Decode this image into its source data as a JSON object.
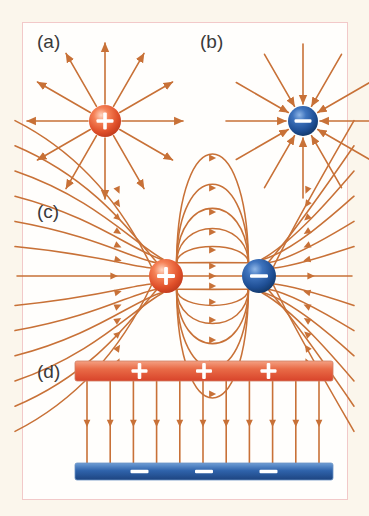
{
  "figure": {
    "background_color": "#fbf6ec",
    "page_color": "#fffefc",
    "border_color": "#f2c9c9",
    "field_line_color": "#c87137",
    "positive_color": "#e0502a",
    "positive_color_light": "#f79b7a",
    "negative_color": "#1f4f95",
    "negative_color_light": "#5b8fd4",
    "plate_positive_color": "#e35336",
    "plate_negative_color": "#2d5ea8"
  },
  "panels": [
    {
      "id": "a",
      "label": "(a)",
      "kind": "point-charge",
      "charge_sign": "+",
      "charge_symbol": "+",
      "field_direction": "outward",
      "num_field_lines": 12,
      "charge_center": [
        82,
        98
      ],
      "charge_radius": 16,
      "line_length": 62
    },
    {
      "id": "b",
      "label": "(b)",
      "kind": "point-charge",
      "charge_sign": "-",
      "charge_symbol": "−",
      "field_direction": "inward",
      "num_field_lines": 12,
      "charge_center": [
        117,
        98
      ],
      "charge_radius": 15,
      "line_length": 62
    },
    {
      "id": "c",
      "label": "(c)",
      "kind": "dipole",
      "positive_center": [
        143,
        79
      ],
      "negative_center": [
        236,
        79
      ],
      "charge_radius": 17,
      "num_field_lines": 13,
      "field_direction": "positive-to-negative"
    },
    {
      "id": "d",
      "label": "(d)",
      "kind": "parallel-plates",
      "top_plate_sign": "+",
      "bottom_plate_sign": "−",
      "top_plate_symbols": 3,
      "bottom_plate_symbols": 3,
      "num_field_lines": 11,
      "field_direction": "downward",
      "top_plate": {
        "x": 52,
        "y": 16,
        "width": 258,
        "height": 20
      },
      "bottom_plate": {
        "x": 52,
        "y": 118,
        "width": 258,
        "height": 17
      }
    }
  ]
}
